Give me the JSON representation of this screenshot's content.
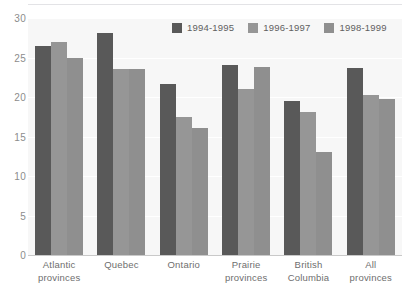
{
  "chart_data": {
    "type": "bar",
    "title": "",
    "xlabel": "",
    "ylabel": "",
    "ylim": [
      0,
      30
    ],
    "yticks": [
      0,
      5,
      10,
      15,
      20,
      25,
      30
    ],
    "grid": true,
    "legend_position": "top-right",
    "categories": [
      "Atlantic provinces",
      "Quebec",
      "Ontario",
      "Prairie provinces",
      "British Columbia",
      "All provinces"
    ],
    "category_lines": [
      [
        "Atlantic",
        "provinces"
      ],
      [
        "Quebec",
        ""
      ],
      [
        "Ontario",
        ""
      ],
      [
        "Prairie",
        "provinces"
      ],
      [
        "British",
        "Columbia"
      ],
      [
        "All",
        "provinces"
      ]
    ],
    "series": [
      {
        "name": "1994-1995",
        "color": "#595959",
        "values": [
          26.4,
          28.1,
          21.6,
          24.1,
          19.5,
          23.7
        ]
      },
      {
        "name": "1996-1997",
        "color": "#969696",
        "values": [
          27.0,
          23.5,
          17.5,
          21.0,
          18.1,
          20.2
        ]
      },
      {
        "name": "1998-1999",
        "color": "#8f8f8f",
        "values": [
          25.0,
          23.6,
          16.1,
          23.8,
          13.1,
          19.8
        ]
      }
    ]
  },
  "colors": {
    "plot_background": "#f7f7f7",
    "page_background": "#ffffff",
    "gridline": "#ffffff",
    "axis_text": "#8c8c8c",
    "label_text": "#6e6e6e",
    "baseline": "#c9c9c9"
  }
}
